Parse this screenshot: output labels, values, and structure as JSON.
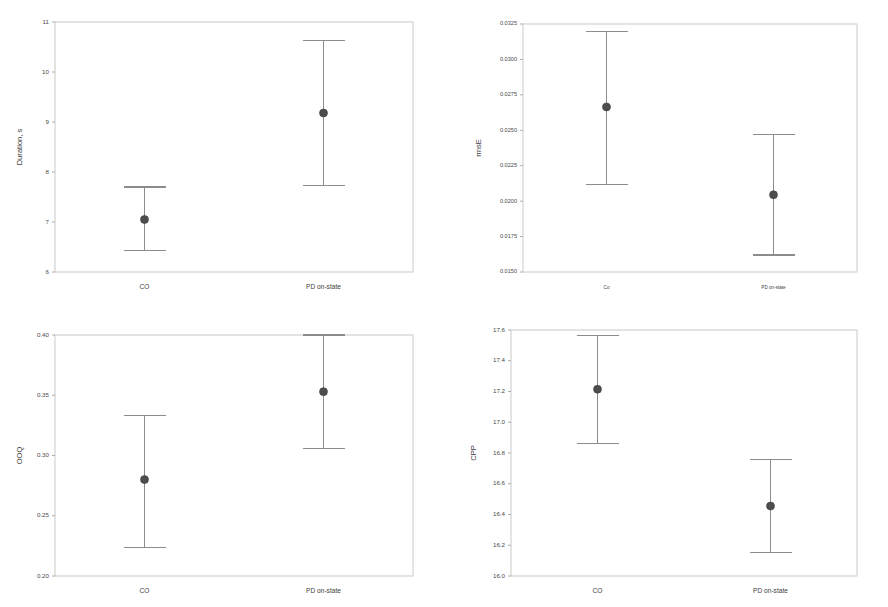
{
  "figure": {
    "type": "multi-panel-error-bar-figure",
    "panel_count": 4,
    "background": "#ffffff",
    "marker_color": "#4d4d4d",
    "errorbar_color": "#8c8c8c",
    "frame_color": "#c9c9c9"
  },
  "chart_data": [
    {
      "panel": "top-left",
      "type": "scatter",
      "title": "",
      "xlabel": "",
      "ylabel": "Duration, s",
      "categories": [
        "CO",
        "PD on-state"
      ],
      "ylim": [
        6,
        11
      ],
      "yticks": [
        6,
        7,
        8,
        9,
        10,
        11
      ],
      "ytick_labels": [
        "6",
        "7",
        "8",
        "9",
        "10",
        "11"
      ],
      "grid": false,
      "legend": "none",
      "series": [
        {
          "name": "mean with 95% CI",
          "values": [
            7.05,
            9.18
          ],
          "error_low": [
            6.43,
            7.73
          ],
          "error_high": [
            7.7,
            10.63
          ]
        }
      ]
    },
    {
      "panel": "top-right",
      "type": "scatter",
      "title": "",
      "xlabel": "",
      "ylabel": "rmsE",
      "categories": [
        "Co",
        "PD on-state"
      ],
      "ylim": [
        0.015,
        0.0325
      ],
      "yticks": [
        0.015,
        0.0175,
        0.02,
        0.0225,
        0.025,
        0.0275,
        0.03,
        0.0325
      ],
      "ytick_labels": [
        "0.0150",
        "0.0175",
        "0.0200",
        "0.0225",
        "0.0250",
        "0.0275",
        "0.0300",
        "0.0325"
      ],
      "grid": false,
      "legend": "none",
      "series": [
        {
          "name": "mean with 95% CI",
          "values": [
            0.02665,
            0.02045
          ],
          "error_low": [
            0.0212,
            0.0162
          ],
          "error_high": [
            0.03195,
            0.0247
          ]
        }
      ]
    },
    {
      "panel": "bottom-left",
      "type": "scatter",
      "title": "",
      "xlabel": "",
      "ylabel": "OOQ",
      "categories": [
        "CO",
        "PD on-state"
      ],
      "ylim": [
        0.2,
        0.4
      ],
      "yticks": [
        0.2,
        0.25,
        0.3,
        0.35,
        0.4
      ],
      "ytick_labels": [
        "0.20",
        "0.25",
        "0.30",
        "0.35",
        "0.40"
      ],
      "grid": false,
      "legend": "none",
      "series": [
        {
          "name": "mean with 95% CI",
          "values": [
            0.28,
            0.353
          ],
          "error_low": [
            0.2235,
            0.3055
          ],
          "error_high": [
            0.3335,
            0.4
          ]
        }
      ]
    },
    {
      "panel": "bottom-right",
      "type": "scatter",
      "title": "",
      "xlabel": "",
      "ylabel": "CPP",
      "categories": [
        "CO",
        "PD on-state"
      ],
      "ylim": [
        16.0,
        17.6
      ],
      "yticks": [
        16.0,
        16.2,
        16.4,
        16.6,
        16.8,
        17.0,
        17.2,
        17.4,
        17.6
      ],
      "ytick_labels": [
        "16.0",
        "16.2",
        "16.4",
        "16.6",
        "16.8",
        "17.0",
        "17.2",
        "17.4",
        "17.6"
      ],
      "grid": false,
      "legend": "none",
      "series": [
        {
          "name": "mean with 95% CI",
          "values": [
            17.215,
            16.455
          ],
          "error_low": [
            16.86,
            16.155
          ],
          "error_high": [
            17.565,
            16.755
          ]
        }
      ]
    }
  ]
}
